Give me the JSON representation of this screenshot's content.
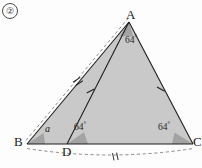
{
  "figure": {
    "number": "②",
    "vertices": {
      "A": {
        "label": "A",
        "x": 129,
        "y": 22
      },
      "B": {
        "label": "B",
        "x": 27,
        "y": 144
      },
      "C": {
        "label": "C",
        "x": 193,
        "y": 144
      },
      "D": {
        "label": "D",
        "x": 67,
        "y": 144
      }
    },
    "angles": [
      {
        "at": "A",
        "label": "64",
        "degree_symbol": "°",
        "value": 64
      },
      {
        "at": "D",
        "label": "64",
        "degree_symbol": "°",
        "value": 64
      },
      {
        "at": "C",
        "label": "64",
        "degree_symbol": "°",
        "value": 64
      },
      {
        "at": "B",
        "label": "a",
        "value": null
      }
    ],
    "tick_marks": {
      "double": [
        "BA-dashed",
        "DC-dashed-arc"
      ],
      "single": [
        "AD",
        "AC"
      ]
    },
    "colors": {
      "fill": "#c9c9c9",
      "angle_wedge": "#a3a3a3",
      "stroke": "#1f1f1f",
      "dashed": "#8c8c8c",
      "background": "#fdfdfd"
    }
  }
}
